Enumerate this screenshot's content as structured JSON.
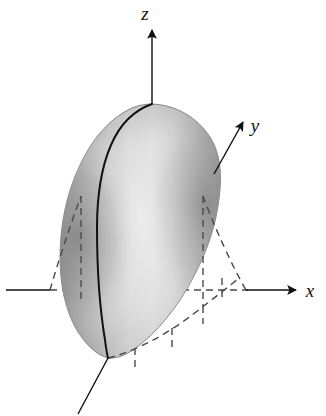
{
  "figure": {
    "width": 326,
    "height": 416,
    "background_color": "#ffffff",
    "caption": ""
  },
  "axes": {
    "x": {
      "label": "x",
      "icon": "arrow-right-icon",
      "label_position": {
        "x": 309,
        "y": 295
      },
      "line": {
        "x1": 6,
        "y1": 290,
        "x2": 298,
        "y2": 290
      },
      "arrow_tip": {
        "x": 302,
        "y": 290
      },
      "solid_segments": [
        {
          "x1": 6,
          "y1": 290,
          "x2": 50,
          "y2": 290
        },
        {
          "x1": 248,
          "y1": 290,
          "x2": 298,
          "y2": 290
        }
      ],
      "dashed_segment": {
        "x1": 50,
        "y1": 290,
        "x2": 248,
        "y2": 290
      }
    },
    "y": {
      "label": "y",
      "icon": "arrow-up-right-icon",
      "label_position": {
        "x": 258,
        "y": 130
      },
      "line": {
        "x1": 152,
        "y1": 290,
        "x2": 244,
        "y2": 122
      },
      "arrow_tip": {
        "x": 246,
        "y": 118
      },
      "visible_solid_from": {
        "x": 215,
        "y": 157
      },
      "dashed_interior": {
        "x1": 152,
        "y1": 290,
        "x2": 215,
        "y2": 175
      },
      "negative_branch": {
        "x1": 108,
        "y1": 358,
        "x2": 78,
        "y2": 414
      }
    },
    "z": {
      "label": "z",
      "icon": "arrow-up-icon",
      "label_position": {
        "x": 147,
        "y": 18
      },
      "line": {
        "x1": 152,
        "y1": 290,
        "x2": 152,
        "y2": 28
      },
      "arrow_tip": {
        "x": 152,
        "y": 24
      },
      "visible_solid_from": {
        "x": 152,
        "y": 105
      },
      "dashed_interior": {
        "x1": 152,
        "y1": 290,
        "x2": 152,
        "y2": 105
      }
    }
  },
  "origin": {
    "x": 152,
    "y": 290,
    "label": ""
  },
  "solid": {
    "name": "shaded-paraboloid-solid",
    "apex": {
      "x": 152,
      "y": 105
    },
    "bottom_point": {
      "x": 108,
      "y": 358
    },
    "left_extent": 60,
    "right_extent": 218,
    "top_extent": 102,
    "bottom_extent": 362,
    "fill_light": "#eeeeee",
    "fill_mid": "#cfcfcf",
    "fill_dark": "#9a9a9a",
    "outline_color": "#8a8a8a"
  },
  "curves": {
    "front_trace": {
      "name": "solid-front-trace-curve",
      "color": "#111111",
      "width": 2.0,
      "description": "solid dark curve from apex down the front of the solid to the bottom point"
    },
    "dashed": {
      "color": "#4a4a4a",
      "width": 1.4,
      "dash_pattern": "7 5"
    }
  },
  "construction_lines": {
    "vertical_dashed_x_positions": [
      80,
      152,
      203,
      222
    ],
    "parabola_left": {
      "from": {
        "x": 50,
        "y": 290
      },
      "to": {
        "x": 98,
        "y": 196
      }
    },
    "parabola_right": {
      "from": {
        "x": 248,
        "y": 290
      },
      "to": {
        "x": 203,
        "y": 196
      }
    },
    "base_ellipse_arc": "dashed arc across the bottom of the solid"
  },
  "colors": {
    "ink": "#111111",
    "dashed_ink": "#4a4a4a",
    "background": "#ffffff"
  }
}
